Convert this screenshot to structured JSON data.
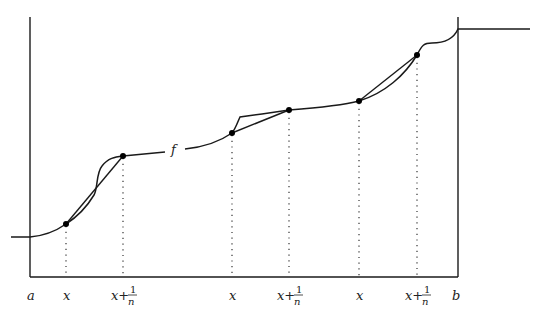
{
  "diagram": {
    "function_label": "f",
    "axis_labels": {
      "left": "a",
      "right": "b"
    },
    "tick_labels": [
      {
        "id": "x1",
        "text": "x",
        "x": 66
      },
      {
        "id": "x1n",
        "text": "x+",
        "num": "1",
        "den": "n",
        "x": 123
      },
      {
        "id": "x2",
        "text": "x",
        "x": 232
      },
      {
        "id": "x2n",
        "text": "x+",
        "num": "1",
        "den": "n",
        "x": 289
      },
      {
        "id": "x3",
        "text": "x",
        "x": 359
      },
      {
        "id": "x3n",
        "text": "x+",
        "num": "1",
        "den": "n",
        "x": 417
      }
    ],
    "points": [
      {
        "x": 66,
        "y": 224
      },
      {
        "x": 123,
        "y": 156
      },
      {
        "x": 232,
        "y": 133
      },
      {
        "x": 289,
        "y": 110
      },
      {
        "x": 359,
        "y": 101
      },
      {
        "x": 417,
        "y": 55
      }
    ],
    "colors": {
      "stroke": "#1a1a1a",
      "background": "#ffffff"
    }
  }
}
